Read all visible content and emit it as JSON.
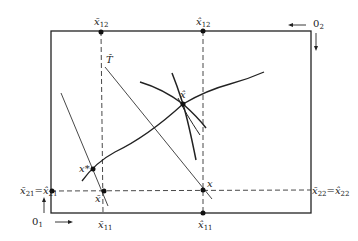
{
  "diagram": {
    "type": "edgeworth-box",
    "colors": {
      "ink": "#222222",
      "background": "#ffffff"
    },
    "origins": {
      "o1": {
        "label": "0",
        "sub": "1"
      },
      "o2": {
        "label": "0",
        "sub": "2"
      }
    },
    "top_labels": {
      "x_bar_12": {
        "label": "x̄",
        "sub": "12"
      },
      "x_hat_12": {
        "label": "x̂",
        "sub": "12"
      }
    },
    "bottom_labels": {
      "x_bar_11": {
        "label": "x̄",
        "sub": "11"
      },
      "x_hat_11": {
        "label": "x̂",
        "sub": "11"
      }
    },
    "left_label": {
      "a": "x̄",
      "a_sub": "21",
      "eq": "=",
      "b": "x̂",
      "b_sub": "21"
    },
    "right_label": {
      "a": "x̄",
      "a_sub": "22",
      "eq": "=",
      "b": "x̂",
      "b_sub": "22"
    },
    "points": {
      "x_star": {
        "label": "x*"
      },
      "x_bar": {
        "label": "x̄"
      },
      "x": {
        "label": "x"
      },
      "x_hat": {
        "label": "x̂"
      }
    },
    "lines": {
      "t_hat": {
        "label": "T̂"
      }
    }
  }
}
